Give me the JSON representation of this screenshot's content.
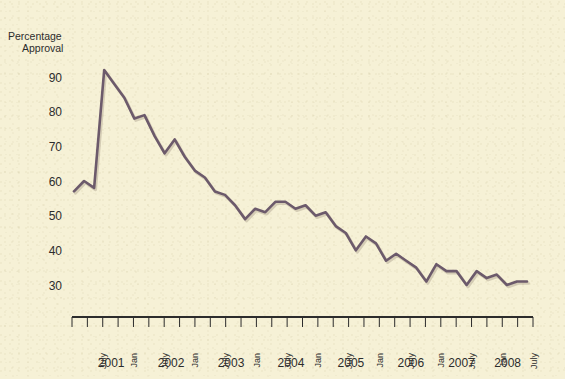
{
  "chart_data": {
    "type": "line",
    "title": "",
    "ylabel": "Percentage\nApproval",
    "ylabel_line1": "Percentage",
    "ylabel_line2": "Approval",
    "xlabel": "",
    "ylim": [
      26,
      95
    ],
    "yticks": [
      30,
      40,
      50,
      60,
      70,
      80,
      90
    ],
    "ytick_labels": [
      "30",
      "40",
      "50",
      "60",
      "70",
      "80",
      "90"
    ],
    "grid": false,
    "legend": "none",
    "line_color": "#6c5a6b",
    "background_color": "#f6f1d6",
    "axis_color": "#2c2c2c",
    "x_tick_labels": [
      "July",
      "Jan",
      "July",
      "Jan",
      "July",
      "Jan",
      "July",
      "Jan",
      "July",
      "Jan",
      "July",
      "Jan",
      "July",
      "Jan",
      "July",
      "Jan",
      "July"
    ],
    "x_year_labels": [
      "2001",
      "2002",
      "2003",
      "2004",
      "2005",
      "2006",
      "2007",
      "2008"
    ],
    "x_year_positions": [
      0.085,
      0.215,
      0.345,
      0.475,
      0.605,
      0.735,
      0.845,
      0.945
    ],
    "x": [
      "2001-Apr",
      "2001-Jun",
      "2001-Aug",
      "2001-Sep",
      "2001-Nov",
      "2002-Jan",
      "2002-Mar",
      "2002-May",
      "2002-Jul",
      "2002-Sep",
      "2002-Nov",
      "2003-Jan",
      "2003-Mar",
      "2003-May",
      "2003-Jul",
      "2003-Sep",
      "2003-Nov",
      "2004-Jan",
      "2004-Mar",
      "2004-May",
      "2004-Jul",
      "2004-Sep",
      "2004-Nov",
      "2005-Jan",
      "2005-Mar",
      "2005-May",
      "2005-Jul",
      "2005-Sep",
      "2005-Nov",
      "2006-Jan",
      "2006-Mar",
      "2006-May",
      "2006-Jul",
      "2006-Sep",
      "2006-Nov",
      "2007-Jan",
      "2007-Mar",
      "2007-May",
      "2007-Jul",
      "2007-Sep",
      "2007-Nov",
      "2008-Jan",
      "2008-Mar",
      "2008-May",
      "2008-Jul",
      "2008-Sep"
    ],
    "values": [
      57,
      60,
      58,
      92,
      88,
      84,
      78,
      79,
      73,
      68,
      72,
      67,
      63,
      61,
      57,
      56,
      53,
      49,
      52,
      51,
      54,
      54,
      52,
      53,
      50,
      51,
      47,
      45,
      40,
      44,
      42,
      37,
      39,
      37,
      35,
      31,
      36,
      34,
      34,
      30,
      34,
      32,
      33,
      30,
      31,
      31
    ]
  },
  "plot_geometry": {
    "x_start_px": 72,
    "x_end_px": 533,
    "y_value_90_px": 77,
    "y_value_30_px": 285,
    "axis_y_px": 317,
    "tick_count": 31,
    "tick_spacing_px": 15.4
  }
}
